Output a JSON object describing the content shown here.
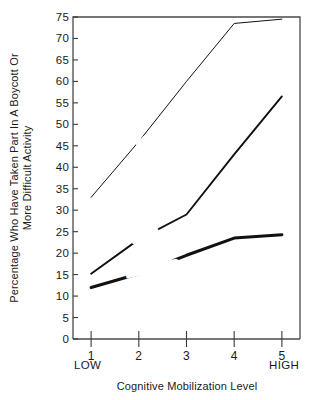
{
  "chart_data": {
    "type": "line",
    "title": "",
    "xlabel": "Cognitive Mobilization Level",
    "ylabel": "Percentage Who Have Taken Part In A Boycott Or More Difficult Activity",
    "ylabel_line1": "Percentage Who Have Taken Part In A Boycott Or",
    "ylabel_line2": "More Difficult Activity",
    "x": [
      1,
      2,
      3,
      4,
      5
    ],
    "xtick_labels": [
      "1",
      "2",
      "3",
      "4",
      "5"
    ],
    "xtick_low_label": "LOW",
    "xtick_high_label": "HIGH",
    "ytick_labels": [
      "0",
      "5",
      "10",
      "15",
      "20",
      "25",
      "30",
      "35",
      "40",
      "45",
      "50",
      "55",
      "60",
      "65",
      "70",
      "75"
    ],
    "ytick_values": [
      0,
      5,
      10,
      15,
      20,
      25,
      30,
      35,
      40,
      45,
      50,
      55,
      60,
      65,
      70,
      75
    ],
    "xlim": [
      0.62,
      5.38
    ],
    "ylim": [
      0,
      75
    ],
    "grid": false,
    "legend": "inline-labels",
    "series": [
      {
        "name": "Postmaterialists",
        "label": "Postmaterialists",
        "values": [
          33,
          46,
          60,
          73.5,
          74.5
        ],
        "color": "#111111",
        "stroke_width": 1.0
      },
      {
        "name": "Mixed",
        "label": "Mixed",
        "values": [
          15.2,
          23.2,
          29,
          43,
          56.5
        ],
        "color": "#111111",
        "stroke_width": 1.9
      },
      {
        "name": "Materialists",
        "label": "Materialists",
        "values": [
          12,
          15.2,
          19.5,
          23.5,
          24.3
        ],
        "color": "#111111",
        "stroke_width": 3.0
      }
    ]
  }
}
